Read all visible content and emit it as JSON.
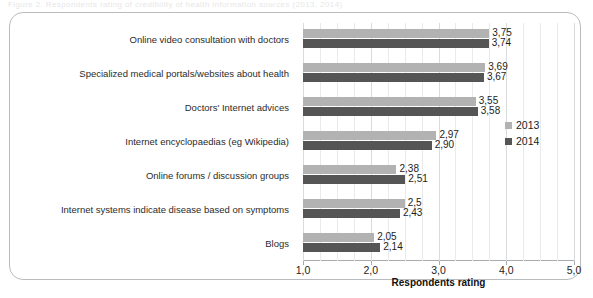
{
  "page": {
    "top_sliver_text": "Figure 2. Respondents rating of credibility of health information sources (2013, 2014)"
  },
  "chart_data": {
    "type": "bar",
    "orientation": "horizontal",
    "title": "",
    "xlabel": "Respondents rating",
    "ylabel": "",
    "xlim": [
      1.0,
      5.0
    ],
    "xticks": [
      "1,0",
      "2,0",
      "3,0",
      "4,0",
      "5,0"
    ],
    "xtick_values": [
      1.0,
      2.0,
      3.0,
      4.0,
      5.0
    ],
    "grid": true,
    "legend_position": "right",
    "categories": [
      "Online video consultation with doctors",
      "Specialized medical portals/websites about health",
      "Doctors' Internet advices",
      "Internet encyclopaedias  (eg Wikipedia)",
      "Online forums / discussion groups",
      "Internet systems indicate disease based on symptoms",
      "Blogs"
    ],
    "series": [
      {
        "name": "2013",
        "color": "#b2b2b2",
        "values": [
          3.75,
          3.69,
          3.55,
          2.97,
          2.38,
          2.5,
          2.05
        ],
        "labels": [
          "3,75",
          "3,69",
          "3,55",
          "2,97",
          "2,38",
          "2,5",
          "2,05"
        ]
      },
      {
        "name": "2014",
        "color": "#555555",
        "values": [
          3.74,
          3.67,
          3.58,
          2.9,
          2.51,
          2.43,
          2.14
        ],
        "labels": [
          "3,74",
          "3,67",
          "3,58",
          "2,90",
          "2,51",
          "2,43",
          "2,14"
        ]
      }
    ]
  }
}
